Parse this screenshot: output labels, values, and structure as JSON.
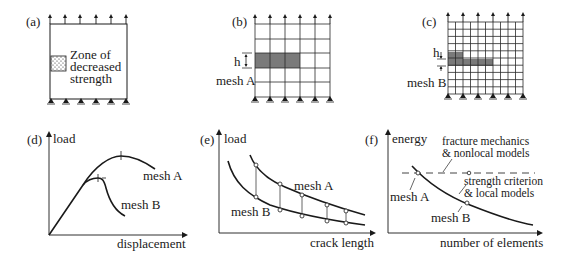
{
  "panels": {
    "a": {
      "label": "(a)",
      "zone_line1": "Zone of",
      "zone_line2": "decreased",
      "zone_line3": "strength"
    },
    "b": {
      "label": "(b)",
      "h_label": "h",
      "mesh_label": "mesh A",
      "grid": {
        "cols": 5,
        "rows": 5
      }
    },
    "c": {
      "label": "(c)",
      "h_label": "h",
      "mesh_label": "mesh B",
      "grid": {
        "cols": 10,
        "rows": 10
      }
    },
    "d": {
      "label": "(d)",
      "ylabel": "load",
      "xlabel": "displacement",
      "mesh_a": "mesh A",
      "mesh_b": "mesh B"
    },
    "e": {
      "label": "(e)",
      "ylabel": "load",
      "xlabel": "crack length",
      "mesh_a": "mesh A",
      "mesh_b": "mesh B"
    },
    "f": {
      "label": "(f)",
      "ylabel": "energy",
      "xlabel": "number of elements",
      "dashed_line1": "fracture mechanics",
      "dashed_line2": "& nonlocal models",
      "curve_line1": "strength criterion",
      "curve_line2": "& local models",
      "mesh_a": "mesh A",
      "mesh_b": "mesh B"
    }
  },
  "colors": {
    "ink": "#1a1a1a",
    "damaged_fill": "#7a7a7a",
    "background": "#ffffff"
  }
}
